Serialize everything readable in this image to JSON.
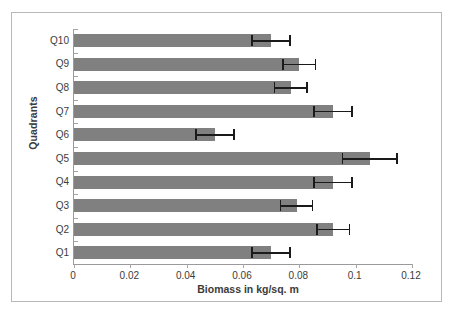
{
  "chart_data": {
    "type": "bar",
    "orientation": "horizontal",
    "title": "",
    "xlabel": "Biomass in kg/sq. m",
    "ylabel": "Quadrants",
    "categories": [
      "Q1",
      "Q2",
      "Q3",
      "Q4",
      "Q5",
      "Q6",
      "Q7",
      "Q8",
      "Q9",
      "Q10"
    ],
    "values": [
      0.07,
      0.092,
      0.079,
      0.092,
      0.105,
      0.05,
      0.092,
      0.077,
      0.08,
      0.07
    ],
    "errors": [
      0.007,
      0.006,
      0.006,
      0.007,
      0.01,
      0.007,
      0.007,
      0.006,
      0.006,
      0.007
    ],
    "xlim": [
      0,
      0.12
    ],
    "xticks": [
      0,
      0.02,
      0.04,
      0.06,
      0.08,
      0.1,
      0.12
    ],
    "xtick_labels": [
      "0",
      "0.02",
      "0.04",
      "0.06",
      "0.08",
      "0.1",
      "0.12"
    ],
    "grid": false,
    "legend": false,
    "bar_color": "#808080",
    "error_color": "#1a1a1a",
    "axis_color": "#9a9a9a",
    "frame_color": "#b8b8b8",
    "text_color": "#3b3b3b",
    "series": [
      {
        "name": "Biomass",
        "values": [
          0.07,
          0.092,
          0.079,
          0.092,
          0.105,
          0.05,
          0.092,
          0.077,
          0.08,
          0.07
        ]
      }
    ]
  },
  "axes": {
    "x_title": "Biomass in kg/sq. m",
    "y_title": "Quadrants"
  }
}
